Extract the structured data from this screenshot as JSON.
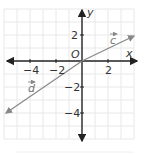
{
  "figure": {
    "axes": {
      "x_label": "x",
      "y_label": "y",
      "origin_label": "O"
    },
    "x_ticks": [
      {
        "value": -4,
        "label": "−4"
      },
      {
        "value": -2,
        "label": "−2"
      },
      {
        "value": 2,
        "label": "2"
      }
    ],
    "y_ticks": [
      {
        "value": 2,
        "label": "2"
      },
      {
        "value": -2,
        "label": "−2"
      },
      {
        "value": -4,
        "label": "−4"
      }
    ],
    "vectors": [
      {
        "name": "c",
        "label": "c",
        "tip": [
          4,
          2
        ]
      },
      {
        "name": "d",
        "label": "d",
        "tip": [
          -6,
          -4
        ]
      }
    ],
    "colors": {
      "axis": "#222222",
      "vector": "#888888",
      "grid": "#e6e6e6"
    }
  }
}
